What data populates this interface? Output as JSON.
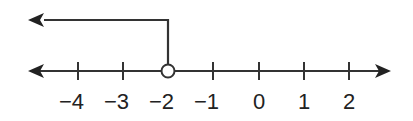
{
  "diagram": {
    "type": "number-line",
    "ticks": [
      {
        "value": -4,
        "label": "−4",
        "x": 78
      },
      {
        "value": -3,
        "label": "−3",
        "x": 123
      },
      {
        "value": -2,
        "label": "−2",
        "x": 168
      },
      {
        "value": -1,
        "label": "−1",
        "x": 213
      },
      {
        "value": 0,
        "label": "0",
        "x": 259
      },
      {
        "value": 1,
        "label": "1",
        "x": 304
      },
      {
        "value": 2,
        "label": "2",
        "x": 349
      }
    ],
    "endpoint": {
      "value": -2,
      "type": "open-circle"
    },
    "ray_direction": "left",
    "colors": {
      "line": "#333333",
      "fill": "#ffffff",
      "text": "#222222"
    }
  }
}
